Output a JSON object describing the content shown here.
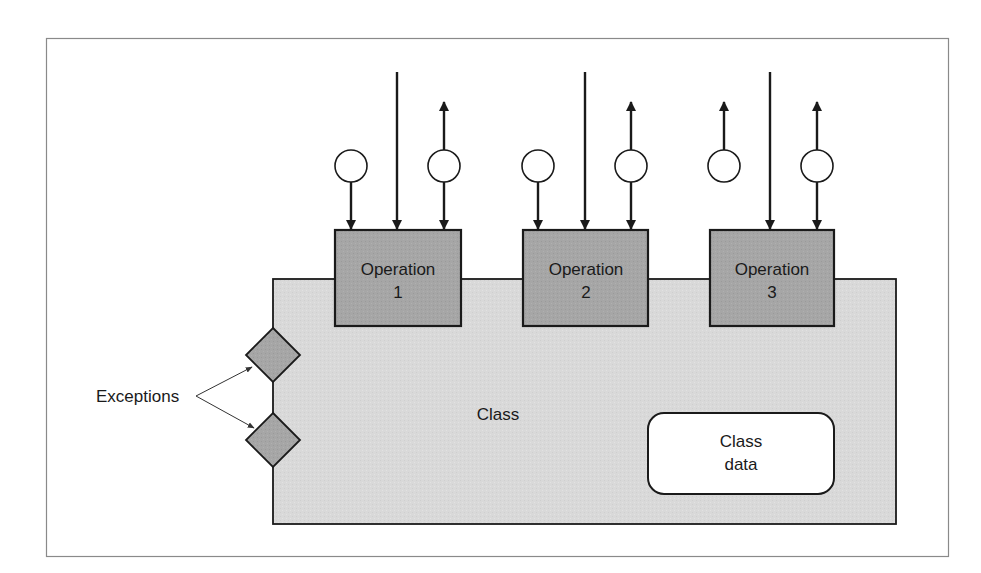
{
  "diagram": {
    "type": "class-interface-diagram",
    "colors": {
      "frame": "#8a8a8a",
      "class_fill": "#d9d9d9",
      "operation_fill": "#a6a6a6",
      "exception_fill": "#a6a6a6",
      "class_data_fill": "#ffffff",
      "stroke": "#1a1a1a",
      "background": "#ffffff"
    },
    "class_label": "Class",
    "class_data": {
      "line1": "Class",
      "line2": "data"
    },
    "exceptions_label": "Exceptions",
    "operations": [
      {
        "name": "Operation",
        "number": "1",
        "connectors": [
          {
            "kind": "circle-in",
            "description": "input parameter flowing into operation"
          },
          {
            "kind": "control-in",
            "description": "invocation line into operation"
          },
          {
            "kind": "circle-inout",
            "description": "parameter with arrow to and from operation"
          }
        ]
      },
      {
        "name": "Operation",
        "number": "2",
        "connectors": [
          {
            "kind": "circle-in",
            "description": "input parameter flowing into operation"
          },
          {
            "kind": "control-in",
            "description": "invocation line into operation"
          },
          {
            "kind": "circle-inout",
            "description": "parameter with arrow to and from operation"
          }
        ]
      },
      {
        "name": "Operation",
        "number": "3",
        "connectors": [
          {
            "kind": "circle-out",
            "description": "output parameter with upward arrow"
          },
          {
            "kind": "control-in",
            "description": "invocation line into operation"
          },
          {
            "kind": "circle-inout",
            "description": "parameter with arrow to and from operation"
          }
        ]
      }
    ],
    "exceptions": [
      {
        "shape": "diamond",
        "index": 1
      },
      {
        "shape": "diamond",
        "index": 2
      }
    ]
  }
}
